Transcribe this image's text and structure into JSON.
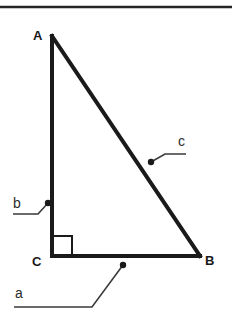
{
  "figure": {
    "kind": "right-triangle-diagram",
    "background_color": "#ffffff",
    "stroke_color": "#1a1a1a",
    "leader_color": "#3a3a3a",
    "top_rule": {
      "present": true,
      "y": 7,
      "x_start": 0,
      "x_end": 232,
      "thickness": 2.5,
      "color": "#262626"
    },
    "triangle": {
      "stroke_width": 4,
      "vertices": [
        {
          "name": "A",
          "x": 52,
          "y": 36
        },
        {
          "name": "B",
          "x": 200,
          "y": 256
        },
        {
          "name": "C",
          "x": 52,
          "y": 256
        }
      ],
      "sides": [
        {
          "name": "a",
          "from": "C",
          "to": "B",
          "orientation": "horizontal"
        },
        {
          "name": "b",
          "from": "A",
          "to": "C",
          "orientation": "vertical"
        },
        {
          "name": "c",
          "from": "A",
          "to": "B",
          "orientation": "hypotenuse"
        }
      ]
    },
    "right_angle_marker": {
      "at_vertex": "C",
      "x": 53,
      "y": 236,
      "size": 19,
      "stroke_width": 2
    },
    "vertex_labels": [
      {
        "text": "A",
        "x": 33,
        "y": 40,
        "weight": "bold"
      },
      {
        "text": "B",
        "x": 205,
        "y": 265,
        "weight": "bold"
      },
      {
        "text": "C",
        "x": 32,
        "y": 266,
        "weight": "bold"
      }
    ],
    "side_labels": [
      {
        "text": "c",
        "x": 178,
        "y": 146,
        "dot": {
          "x": 151,
          "y": 162,
          "r": 3.2
        },
        "leader": "M151,162 L165,154 L186,154"
      },
      {
        "text": "b",
        "x": 13,
        "y": 208,
        "dot": {
          "x": 48,
          "y": 203,
          "r": 3.2
        },
        "leader": "M48,203 L38,214 L13,214"
      },
      {
        "text": "a",
        "x": 15,
        "y": 298,
        "dot": {
          "x": 123,
          "y": 265,
          "r": 3.2
        },
        "leader": "M123,265 L92,307 L14,307"
      }
    ]
  }
}
